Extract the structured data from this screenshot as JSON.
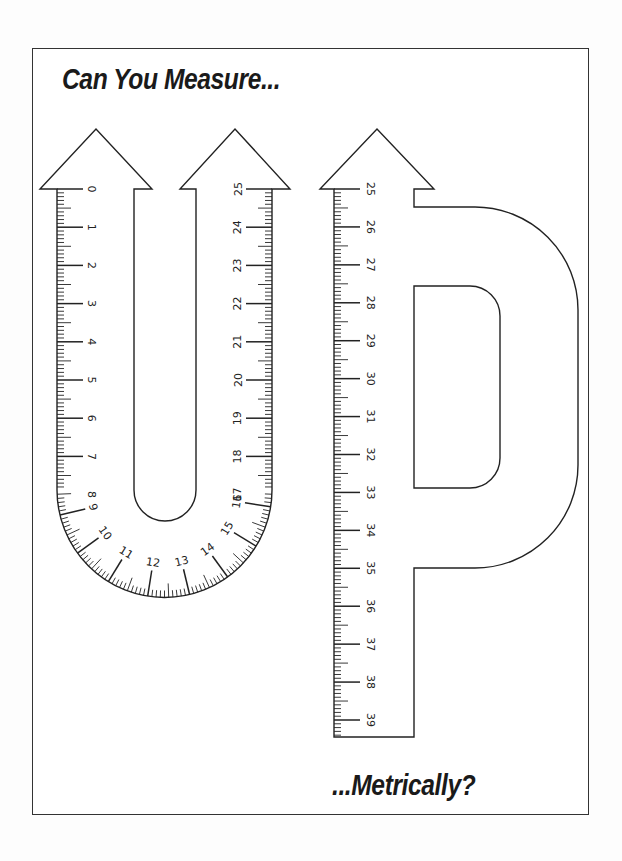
{
  "worksheet": {
    "title": "Can You Measure...",
    "subtitle": "...Metrically?"
  },
  "letters": [
    {
      "name": "U",
      "description": "U-shaped ruler with arrows pointing up on both arms"
    },
    {
      "name": "P",
      "description": "P-shaped ruler with arrow pointing up on the stem"
    }
  ],
  "rulers": {
    "u_left_arm": {
      "labels": [
        "0",
        "1",
        "2",
        "3",
        "4",
        "5",
        "6",
        "7",
        "8"
      ],
      "start_value": 0,
      "end_value": 8.4,
      "direction": "down"
    },
    "u_curve": {
      "labels": [
        "9",
        "10",
        "11",
        "12",
        "13",
        "14",
        "15",
        "16"
      ],
      "start_value": 8.4,
      "end_value": 16.4
    },
    "u_right_arm": {
      "labels": [
        "17",
        "18",
        "19",
        "20",
        "21",
        "22",
        "23",
        "24",
        "25"
      ],
      "start_value": 16.4,
      "end_value": 25,
      "direction": "up"
    },
    "p_stem": {
      "labels": [
        "25",
        "26",
        "27",
        "28",
        "29",
        "30",
        "31",
        "32",
        "33",
        "34",
        "35",
        "36",
        "37",
        "38",
        "39"
      ],
      "start_value": 25,
      "end_value": 39.4,
      "direction": "down"
    }
  },
  "units": "cm",
  "colors": {
    "line": "#222222",
    "background": "#ffffff",
    "frame": "#333333"
  }
}
